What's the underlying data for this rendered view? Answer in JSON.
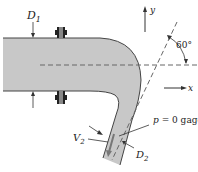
{
  "diagram": {
    "type": "pipe-bend-schematic",
    "labels": {
      "d1": "D",
      "d1_sub": "1",
      "d2": "D",
      "d2_sub": "2",
      "v2": "V",
      "v2_sub": "2",
      "pressure": "p = 0 gage",
      "angle": "60°",
      "y_axis": "y",
      "x_axis": "x"
    },
    "colors": {
      "pipe_fill": "#c8c8c8",
      "pipe_stroke": "#444444",
      "line": "#333333",
      "dash": "#666666",
      "flange": "#222222"
    }
  }
}
